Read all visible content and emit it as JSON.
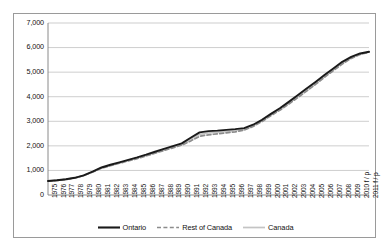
{
  "chart_data": {
    "type": "line",
    "title": "",
    "xlabel": "",
    "ylabel": "",
    "ylim": [
      0,
      7000
    ],
    "ytick_labels": [
      "0",
      "1,000",
      "2,000",
      "3,000",
      "4,000",
      "5,000",
      "6,000",
      "7,000"
    ],
    "ytick_values": [
      0,
      1000,
      2000,
      3000,
      4000,
      5000,
      6000,
      7000
    ],
    "grid": "horizontal",
    "legend_position": "bottom",
    "categories": [
      "1975",
      "1976",
      "1977",
      "1978",
      "1979",
      "1980",
      "1981",
      "1982",
      "1983",
      "1984",
      "1985",
      "1986",
      "1987",
      "1988",
      "1989",
      "1990",
      "1991",
      "1992",
      "1993",
      "1994",
      "1995",
      "1996",
      "1997",
      "1998",
      "1999",
      "2000",
      "2001",
      "2002",
      "2003",
      "2004",
      "2005",
      "2006",
      "2007",
      "2008",
      "2009",
      "2010 f / p",
      "2011 f / p"
    ],
    "series": [
      {
        "name": "Ontario",
        "color": "#1a1a1a",
        "style": "solid",
        "width": 1.9,
        "values": [
          570,
          600,
          640,
          700,
          800,
          950,
          1120,
          1230,
          1330,
          1430,
          1530,
          1640,
          1760,
          1880,
          1990,
          2100,
          2330,
          2550,
          2600,
          2620,
          2650,
          2680,
          2720,
          2860,
          3060,
          3300,
          3530,
          3790,
          4060,
          4330,
          4600,
          4880,
          5150,
          5420,
          5620,
          5760,
          5830
        ]
      },
      {
        "name": "Rest of Canada",
        "color": "#8c8c8c",
        "style": "dashed",
        "width": 1.7,
        "values": [
          560,
          590,
          630,
          690,
          790,
          935,
          1090,
          1190,
          1290,
          1390,
          1480,
          1590,
          1700,
          1810,
          1920,
          2030,
          2200,
          2390,
          2450,
          2490,
          2530,
          2570,
          2640,
          2790,
          2990,
          3230,
          3450,
          3700,
          3960,
          4230,
          4500,
          4790,
          5060,
          5330,
          5560,
          5720,
          5810
        ]
      },
      {
        "name": "Canada",
        "color": "#c4c4c4",
        "style": "solid",
        "width": 1.7,
        "values": [
          565,
          595,
          635,
          695,
          795,
          942,
          1105,
          1210,
          1310,
          1410,
          1505,
          1615,
          1730,
          1845,
          1955,
          2065,
          2265,
          2470,
          2525,
          2555,
          2590,
          2625,
          2680,
          2825,
          3025,
          3265,
          3490,
          3745,
          4010,
          4280,
          4550,
          4835,
          5105,
          5375,
          5590,
          5740,
          5820
        ]
      }
    ]
  },
  "legend": {
    "items": [
      {
        "label": "Ontario"
      },
      {
        "label": "Rest of Canada"
      },
      {
        "label": "Canada"
      }
    ]
  }
}
